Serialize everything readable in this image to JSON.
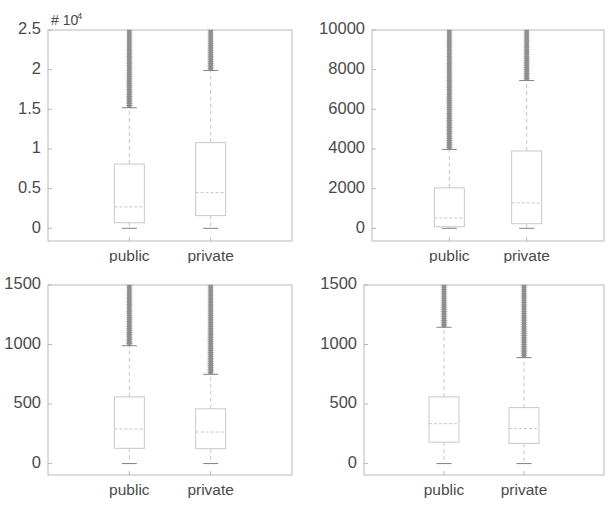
{
  "figure": {
    "width": 608,
    "height": 510,
    "background": "#ffffff",
    "axis_color": "#b9b9b9",
    "box_color": "#c8c8c8",
    "median_color": "#c8c8c8",
    "whisker_color": "#c6c6c6",
    "outlier_color": "#808080",
    "tick_text_color": "#4a4a4a"
  },
  "chart_data": [
    {
      "type": "box",
      "panel": "top-left",
      "title": "",
      "xlabel": "",
      "ylabel": "",
      "units_label": "# 10",
      "units_exponent": "4",
      "categories": [
        "public",
        "private"
      ],
      "ytick_labels": [
        "0",
        "0.5",
        "1",
        "1.5",
        "2",
        "2.5"
      ],
      "ytick_values": [
        0,
        5000,
        10000,
        15000,
        20000,
        25000
      ],
      "ylim": [
        -1600,
        25000
      ],
      "grid": false,
      "boxes": [
        {
          "name": "public",
          "q1": 700,
          "median": 2700,
          "q3": 8100,
          "whisker_low": 0,
          "whisker_high": 15200,
          "outlier_low": 15200,
          "outlier_high": 25000
        },
        {
          "name": "private",
          "q1": 1600,
          "median": 4500,
          "q3": 10800,
          "whisker_low": 0,
          "whisker_high": 19900,
          "outlier_low": 19900,
          "outlier_high": 25000
        }
      ]
    },
    {
      "type": "box",
      "panel": "top-right",
      "title": "",
      "xlabel": "",
      "ylabel": "",
      "units_label": "",
      "units_exponent": "",
      "categories": [
        "public",
        "private"
      ],
      "ytick_labels": [
        "0",
        "2000",
        "4000",
        "6000",
        "8000",
        "10000"
      ],
      "ytick_values": [
        0,
        2000,
        4000,
        6000,
        8000,
        10000
      ],
      "ylim": [
        -640,
        10000
      ],
      "grid": false,
      "boxes": [
        {
          "name": "public",
          "q1": 80,
          "median": 520,
          "q3": 2040,
          "whisker_low": 0,
          "whisker_high": 3980,
          "outlier_low": 3980,
          "outlier_high": 10000
        },
        {
          "name": "private",
          "q1": 230,
          "median": 1280,
          "q3": 3900,
          "whisker_low": 0,
          "whisker_high": 7450,
          "outlier_low": 7450,
          "outlier_high": 10000
        }
      ]
    },
    {
      "type": "box",
      "panel": "bottom-left",
      "title": "",
      "xlabel": "",
      "ylabel": "",
      "units_label": "",
      "units_exponent": "",
      "categories": [
        "public",
        "private"
      ],
      "ytick_labels": [
        "0",
        "500",
        "1000",
        "1500"
      ],
      "ytick_values": [
        0,
        500,
        1000,
        1500
      ],
      "ylim": [
        -96,
        1500
      ],
      "grid": false,
      "boxes": [
        {
          "name": "public",
          "q1": 128,
          "median": 290,
          "q3": 560,
          "whisker_low": 0,
          "whisker_high": 990,
          "outlier_low": 990,
          "outlier_high": 1500
        },
        {
          "name": "private",
          "q1": 125,
          "median": 265,
          "q3": 460,
          "whisker_low": 0,
          "whisker_high": 750,
          "outlier_low": 750,
          "outlier_high": 1500
        }
      ]
    },
    {
      "type": "box",
      "panel": "bottom-right",
      "title": "",
      "xlabel": "",
      "ylabel": "",
      "units_label": "",
      "units_exponent": "",
      "categories": [
        "public",
        "private"
      ],
      "ytick_labels": [
        "0",
        "500",
        "1000",
        "1500"
      ],
      "ytick_values": [
        0,
        500,
        1000,
        1500
      ],
      "ylim": [
        -96,
        1500
      ],
      "grid": false,
      "boxes": [
        {
          "name": "public",
          "q1": 180,
          "median": 335,
          "q3": 560,
          "whisker_low": 0,
          "whisker_high": 1145,
          "outlier_low": 1145,
          "outlier_high": 1500
        },
        {
          "name": "private",
          "q1": 170,
          "median": 295,
          "q3": 470,
          "whisker_low": 0,
          "whisker_high": 890,
          "outlier_low": 890,
          "outlier_high": 1500
        }
      ]
    }
  ],
  "panel_geometry": [
    {
      "left": 4,
      "top": 8,
      "width": 300,
      "height": 255,
      "plot_x0": 44,
      "plot_y0": 22,
      "plot_x1": 288,
      "plot_y1": 233
    },
    {
      "left": 308,
      "top": 8,
      "width": 300,
      "height": 255,
      "plot_x0": 64,
      "plot_y0": 22,
      "plot_x1": 296,
      "plot_y1": 233
    },
    {
      "left": 4,
      "top": 263,
      "width": 300,
      "height": 247,
      "plot_x0": 44,
      "plot_y0": 22,
      "plot_x1": 288,
      "plot_y1": 212
    },
    {
      "left": 308,
      "top": 263,
      "width": 300,
      "height": 247,
      "plot_x0": 56,
      "plot_y0": 22,
      "plot_x1": 296,
      "plot_y1": 212
    }
  ]
}
